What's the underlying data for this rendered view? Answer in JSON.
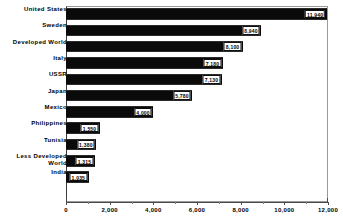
{
  "chart_data": {
    "type": "bar",
    "orientation": "horizontal",
    "title": "",
    "subtitle": "",
    "xlabel": "",
    "ylabel": "",
    "xlim": [
      0,
      12000
    ],
    "xticks": [
      0,
      2000,
      4000,
      6000,
      8000,
      10000,
      12000
    ],
    "xtick_labels": [
      "0",
      "2,000",
      "4,000",
      "6,000",
      "8,000",
      "10,000",
      "12,000"
    ],
    "grid": false,
    "legend": null,
    "bar_color": "#0a0a0a",
    "categories": [
      "United States",
      "Sweden",
      "Developed World",
      "Italy",
      "USSR",
      "Japan",
      "Mexico",
      "Philippines",
      "Tunisia",
      "Less Developed\nWorld",
      "India"
    ],
    "values": [
      11940,
      8940,
      8100,
      7180,
      7130,
      5780,
      4000,
      1550,
      1380,
      1315,
      1035
    ],
    "data_labels": [
      "11,940",
      "8,940",
      "8,100",
      "7,180",
      "7,130",
      "5,780",
      "4,000",
      "1,550",
      "1,380",
      "1,315",
      "1,035"
    ]
  }
}
